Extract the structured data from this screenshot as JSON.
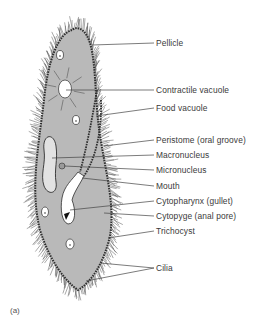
{
  "diagram": {
    "figure_label": "(a)",
    "colors": {
      "cytoplasm": "#b9b9b9",
      "outline": "#2e2e2e",
      "vacuole": "#ffffff",
      "macronucleus": "#e2e2e2",
      "leader": "#444444",
      "label_text": "#3a3a3a"
    },
    "labels": [
      {
        "id": "pellicle",
        "text": "Pellicle"
      },
      {
        "id": "contractile-vacuole",
        "text": "Contractile vacuole"
      },
      {
        "id": "food-vacuole",
        "text": "Food vacuole"
      },
      {
        "id": "peristome",
        "text": "Peristome (oral groove)"
      },
      {
        "id": "macronucleus",
        "text": "Macronucleus"
      },
      {
        "id": "micronucleus",
        "text": "Micronucleus"
      },
      {
        "id": "mouth",
        "text": "Mouth"
      },
      {
        "id": "cytopharynx",
        "text": "Cytopharynx (gullet)"
      },
      {
        "id": "cytopyge",
        "text": "Cytopyge (anal pore)"
      },
      {
        "id": "trichocyst",
        "text": "Trichocyst"
      },
      {
        "id": "cilia",
        "text": "Cilia"
      }
    ]
  }
}
